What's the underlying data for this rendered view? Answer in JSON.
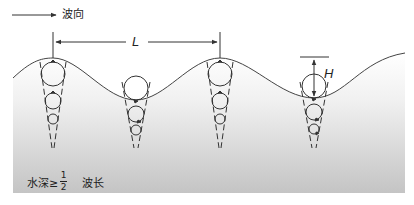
{
  "diagram": {
    "direction_label": "波向",
    "wavelength_symbol": "L",
    "height_symbol": "H",
    "depth_condition": {
      "prefix": "水深≥",
      "fraction_numerator": "1",
      "fraction_denominator": "2",
      "suffix": "波长"
    },
    "colors": {
      "stroke": "#333333",
      "water_top": "#ffffff",
      "water_bottom": "#c4c4c4",
      "background": "#ffffff"
    },
    "particle_columns": [
      {
        "position": "crest",
        "x": 53
      },
      {
        "position": "trough",
        "x": 136
      },
      {
        "position": "crest",
        "x": 220
      },
      {
        "position": "trough",
        "x": 314
      }
    ]
  }
}
